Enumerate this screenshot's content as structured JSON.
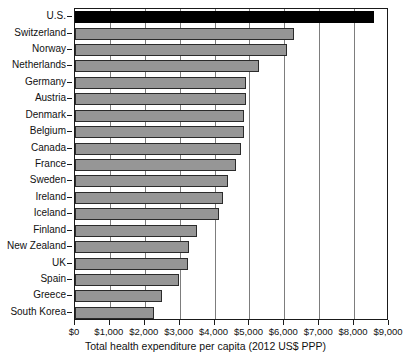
{
  "chart_data": {
    "type": "bar",
    "orientation": "horizontal",
    "title": "",
    "xlabel": "Total health expenditure per capita (2012 US$ PPP)",
    "ylabel": "",
    "xlim": [
      0,
      9000
    ],
    "xtick_labels": [
      "$0",
      "$1,000",
      "$2,000",
      "$3,000",
      "$4,000",
      "$5,000",
      "$6,000",
      "$7,000",
      "$8,000",
      "$9,000"
    ],
    "xtick_values": [
      0,
      1000,
      2000,
      3000,
      4000,
      5000,
      6000,
      7000,
      8000,
      9000
    ],
    "grid": "vertical",
    "legend": "none",
    "highlight_category": "U.S.",
    "highlight_color": "#000000",
    "bar_color": "#969696",
    "bar_edge_color": "#2b2b2b",
    "categories": [
      "U.S.",
      "Switzerland",
      "Norway",
      "Netherlands",
      "Germany",
      "Austria",
      "Denmark",
      "Belgium",
      "Canada",
      "France",
      "Sweden",
      "Ireland",
      "Iceland",
      "Finland",
      "New Zealand",
      "UK",
      "Spain",
      "Greece",
      "South Korea"
    ],
    "values": [
      8570,
      6280,
      6070,
      5270,
      4900,
      4890,
      4840,
      4830,
      4760,
      4610,
      4380,
      4240,
      4130,
      3500,
      3270,
      3240,
      2980,
      2500,
      2270
    ],
    "points": [
      {
        "category": "U.S.",
        "value": 8570
      },
      {
        "category": "Switzerland",
        "value": 6280
      },
      {
        "category": "Norway",
        "value": 6070
      },
      {
        "category": "Netherlands",
        "value": 5270
      },
      {
        "category": "Germany",
        "value": 4900
      },
      {
        "category": "Austria",
        "value": 4890
      },
      {
        "category": "Denmark",
        "value": 4840
      },
      {
        "category": "Belgium",
        "value": 4830
      },
      {
        "category": "Canada",
        "value": 4760
      },
      {
        "category": "France",
        "value": 4610
      },
      {
        "category": "Sweden",
        "value": 4380
      },
      {
        "category": "Ireland",
        "value": 4240
      },
      {
        "category": "Iceland",
        "value": 4130
      },
      {
        "category": "Finland",
        "value": 3500
      },
      {
        "category": "New Zealand",
        "value": 3270
      },
      {
        "category": "UK",
        "value": 3240
      },
      {
        "category": "Spain",
        "value": 2980
      },
      {
        "category": "Greece",
        "value": 2500
      },
      {
        "category": "South Korea",
        "value": 2270
      }
    ]
  }
}
